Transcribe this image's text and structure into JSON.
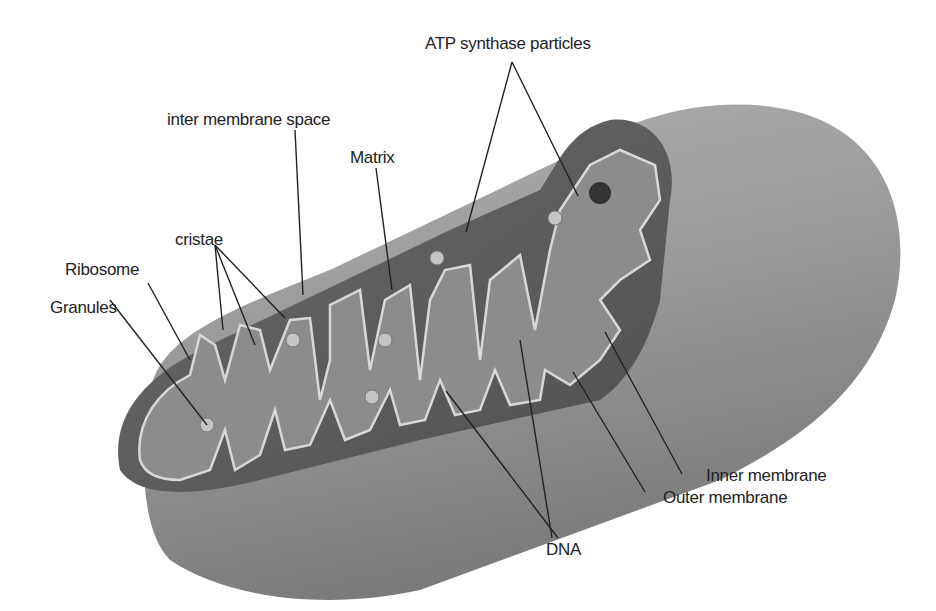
{
  "diagram": {
    "colors": {
      "outer_surface": "#9a9a9a",
      "cut_face_dark": "#5e5e5e",
      "matrix": "#8c8c8c",
      "membrane_line": "#d8d8d8",
      "label_text": "#222222",
      "leader_line": "#222222"
    },
    "labels": {
      "atp": "ATP synthase particles",
      "ims": "inter membrane space",
      "matrix": "Matrix",
      "cristae": "cristae",
      "ribosome": "Ribosome",
      "granules": "Granules",
      "inner": "Inner membrane",
      "outer": "Outer membrane",
      "dna": "DNA"
    }
  }
}
